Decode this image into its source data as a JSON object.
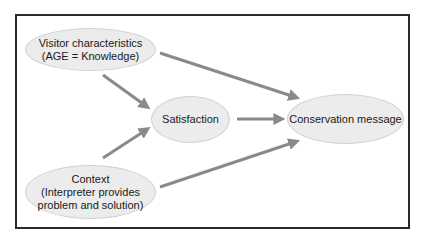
{
  "diagram": {
    "nodes": [
      {
        "id": "visitor",
        "lines": [
          "Visitor characteristics",
          "(AGE = Knowledge)"
        ]
      },
      {
        "id": "satisfaction",
        "lines": [
          "Satisfaction"
        ]
      },
      {
        "id": "conservation",
        "lines": [
          "Conservation message"
        ]
      },
      {
        "id": "context",
        "lines": [
          "Context",
          "(Interpreter provides",
          "problem and solution)"
        ]
      }
    ],
    "edges": [
      {
        "from": "visitor",
        "to": "satisfaction"
      },
      {
        "from": "visitor",
        "to": "conservation"
      },
      {
        "from": "context",
        "to": "satisfaction"
      },
      {
        "from": "context",
        "to": "conservation"
      },
      {
        "from": "satisfaction",
        "to": "conservation"
      }
    ],
    "colors": {
      "node_fill": "#ececec",
      "node_border": "#d0d0d0",
      "arrow": "#8a8a8a",
      "frame": "#2a2a2a"
    }
  }
}
